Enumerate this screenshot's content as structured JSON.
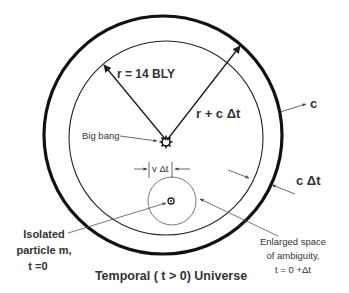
{
  "diagram": {
    "title": "Temporal ( t > 0) Universe",
    "colors": {
      "stroke": "#1a1a1a",
      "text": "#333333",
      "thin_stroke": "#555555",
      "background": "#ffffff"
    },
    "shapes": {
      "outer_circle": {
        "label": "c",
        "cx": 163,
        "cy": 135,
        "r": 120
      },
      "inner_circle": {
        "cx": 166,
        "cy": 138,
        "r": 97
      },
      "ambiguity_circle": {
        "cx": 172,
        "cy": 201,
        "r": 24
      }
    },
    "labels": {
      "radius": "r = 14 BLY",
      "radius_plus": "r + c Δt",
      "big_bang": "Big bang",
      "outer_speed": "c",
      "shell_width": "c Δt",
      "v_dt": "v Δt",
      "particle_line1": "Isolated",
      "particle_line2": "particle m,",
      "particle_line3": "t =0",
      "ambiguity_line1": "Enlarged space",
      "ambiguity_line2": "of ambiguity,",
      "ambiguity_line3": "t = 0 +Δt"
    }
  }
}
